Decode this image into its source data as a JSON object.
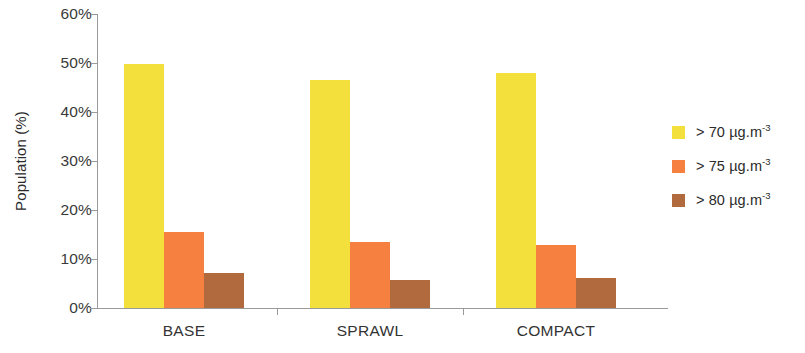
{
  "chart_data": {
    "type": "bar",
    "title": "",
    "xlabel": "",
    "ylabel": "Population (%)",
    "ylim": [
      0,
      60
    ],
    "y_ticks": [
      "0%",
      "10%",
      "20%",
      "30%",
      "40%",
      "50%",
      "60%"
    ],
    "y_tick_values": [
      0,
      10,
      20,
      30,
      40,
      50,
      60
    ],
    "grid": false,
    "legend_position": "right",
    "categories": [
      "BASE",
      "SPRAWL",
      "COMPACT"
    ],
    "series": [
      {
        "name": "> 70 µg.m-3",
        "label_main": "> 70 µg.m",
        "label_sup": "-3",
        "color": "#F4E03C",
        "values": [
          49.8,
          46.5,
          48.0
        ]
      },
      {
        "name": "> 75 µg.m-3",
        "label_main": "> 75 µg.m",
        "label_sup": "-3",
        "color": "#F5803F",
        "values": [
          15.5,
          13.5,
          12.8
        ]
      },
      {
        "name": "> 80 µg.m-3",
        "label_main": "> 80 µg.m",
        "label_sup": "-3",
        "color": "#B06A3E",
        "values": [
          7.2,
          5.7,
          6.1
        ]
      }
    ]
  },
  "colors": {
    "axis": "#9a9a9a",
    "text": "#2b2b2b",
    "background": "#ffffff"
  }
}
